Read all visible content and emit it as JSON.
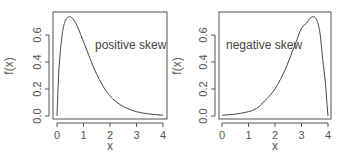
{
  "chart_data": [
    {
      "type": "line",
      "title": "",
      "xlabel": "x",
      "ylabel": "f(x)",
      "xlim": [
        0,
        4
      ],
      "ylim": [
        0,
        0.75
      ],
      "xticks": [
        "0",
        "1",
        "2",
        "3",
        "4"
      ],
      "yticks": [
        "0.0",
        "0.2",
        "0.4",
        "0.6"
      ],
      "annotation": "positive skew",
      "grid": false,
      "legend": null,
      "series": [
        {
          "name": "density",
          "x": [
            0,
            0.05,
            0.1,
            0.2,
            0.3,
            0.4,
            0.5,
            0.6,
            0.7,
            0.8,
            1.0,
            1.2,
            1.4,
            1.6,
            1.8,
            2.0,
            2.2,
            2.5,
            2.8,
            3.0,
            3.3,
            3.6,
            4.0
          ],
          "y": [
            0,
            0.25,
            0.42,
            0.61,
            0.7,
            0.73,
            0.735,
            0.72,
            0.69,
            0.65,
            0.55,
            0.45,
            0.35,
            0.27,
            0.2,
            0.15,
            0.11,
            0.07,
            0.045,
            0.032,
            0.02,
            0.012,
            0.006
          ]
        }
      ]
    },
    {
      "type": "line",
      "title": "",
      "xlabel": "x",
      "ylabel": "f(x)",
      "xlim": [
        0,
        4
      ],
      "ylim": [
        0,
        0.75
      ],
      "xticks": [
        "0",
        "1",
        "2",
        "3",
        "4"
      ],
      "yticks": [
        "0.0",
        "0.2",
        "0.4",
        "0.6"
      ],
      "annotation": "negative skew",
      "grid": false,
      "legend": null,
      "series": [
        {
          "name": "density",
          "x": [
            0,
            0.4,
            0.7,
            1.0,
            1.2,
            1.4,
            1.6,
            1.8,
            2.0,
            2.2,
            2.4,
            2.6,
            2.8,
            3.0,
            3.2,
            3.3,
            3.4,
            3.5,
            3.6,
            3.7,
            3.8,
            3.9,
            3.95,
            4.0
          ],
          "y": [
            0.006,
            0.012,
            0.02,
            0.032,
            0.045,
            0.07,
            0.11,
            0.15,
            0.2,
            0.27,
            0.35,
            0.45,
            0.55,
            0.65,
            0.69,
            0.72,
            0.735,
            0.73,
            0.7,
            0.61,
            0.42,
            0.25,
            0.12,
            0
          ]
        }
      ]
    }
  ]
}
